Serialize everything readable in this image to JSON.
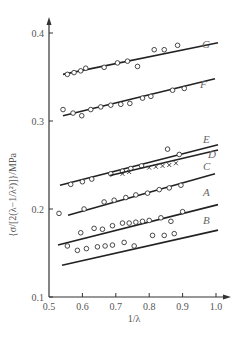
{
  "chart_data": {
    "type": "scatter",
    "title": "",
    "xlabel": "1/λ",
    "ylabel": "{σ/[2(λ−1/λ²)]}/MPa",
    "xlim": [
      0.5,
      1.0
    ],
    "ylim": [
      0.1,
      0.4
    ],
    "xticks": [
      "0.5",
      "0.6",
      "0.7",
      "0.8",
      "0.9",
      "1.0"
    ],
    "yticks": [
      "0.1",
      "0.2",
      "0.3",
      "0.4"
    ],
    "grid": false,
    "legend": "inline labels at right end of each line",
    "series": [
      {
        "name": "G",
        "marker": "o",
        "line": {
          "x": [
            0.542,
            1.006
          ],
          "y": [
            0.353,
            0.389
          ]
        },
        "points": {
          "x": [
            0.555,
            0.575,
            0.595,
            0.61,
            0.665,
            0.705,
            0.735,
            0.765,
            0.815,
            0.845,
            0.885
          ],
          "y": [
            0.353,
            0.355,
            0.357,
            0.36,
            0.361,
            0.366,
            0.368,
            0.362,
            0.381,
            0.381,
            0.386
          ]
        }
      },
      {
        "name": "F",
        "marker": "o",
        "line": {
          "x": [
            0.542,
            0.997
          ],
          "y": [
            0.306,
            0.348
          ]
        },
        "points": {
          "x": [
            0.542,
            0.572,
            0.598,
            0.625,
            0.655,
            0.685,
            0.715,
            0.742,
            0.78,
            0.805,
            0.87,
            0.905
          ],
          "y": [
            0.313,
            0.309,
            0.306,
            0.313,
            0.316,
            0.318,
            0.319,
            0.32,
            0.326,
            0.328,
            0.335,
            0.337
          ]
        }
      },
      {
        "name": "E",
        "marker": "o",
        "line": {
          "x": [
            0.533,
            1.006
          ],
          "y": [
            0.227,
            0.273
          ]
        },
        "points": {
          "x": [
            0.565,
            0.6,
            0.628,
            0.685,
            0.72,
            0.745,
            0.777,
            0.855,
            0.89
          ],
          "y": [
            0.228,
            0.231,
            0.234,
            0.24,
            0.243,
            0.246,
            0.249,
            0.268,
            0.262
          ]
        }
      },
      {
        "name": "D",
        "marker": "x",
        "line": {
          "x": [
            0.683,
            1.006
          ],
          "y": [
            0.238,
            0.267
          ]
        },
        "points": {
          "x": [
            0.72,
            0.74,
            0.8,
            0.82,
            0.84,
            0.86,
            0.88
          ],
          "y": [
            0.24,
            0.242,
            0.247,
            0.248,
            0.249,
            0.25,
            0.252
          ]
        }
      },
      {
        "name": "C",
        "marker": "o",
        "line": {
          "x": [
            0.557,
            0.997
          ],
          "y": [
            0.193,
            0.24
          ]
        },
        "points": {
          "x": [
            0.53,
            0.605,
            0.665,
            0.695,
            0.73,
            0.76,
            0.795,
            0.83,
            0.86,
            0.895
          ],
          "y": [
            0.195,
            0.2,
            0.208,
            0.21,
            0.213,
            0.216,
            0.218,
            0.222,
            0.224,
            0.227
          ]
        }
      },
      {
        "name": "A",
        "marker": "o",
        "line": {
          "x": [
            0.527,
            1.006
          ],
          "y": [
            0.159,
            0.205
          ]
        },
        "points": {
          "x": [
            0.595,
            0.635,
            0.66,
            0.69,
            0.72,
            0.74,
            0.76,
            0.78,
            0.8,
            0.835,
            0.865,
            0.9
          ],
          "y": [
            0.173,
            0.178,
            0.177,
            0.181,
            0.184,
            0.184,
            0.185,
            0.186,
            0.187,
            0.19,
            0.186,
            0.197
          ]
        }
      },
      {
        "name": "B",
        "marker": "o",
        "line": {
          "x": [
            0.539,
            1.006
          ],
          "y": [
            0.136,
            0.176
          ]
        },
        "points": {
          "x": [
            0.555,
            0.585,
            0.612,
            0.645,
            0.668,
            0.69,
            0.725,
            0.755,
            0.81,
            0.845,
            0.875
          ],
          "y": [
            0.158,
            0.153,
            0.155,
            0.157,
            0.158,
            0.159,
            0.162,
            0.158,
            0.17,
            0.17,
            0.172
          ]
        }
      }
    ]
  },
  "axes": {
    "x_title": "1/λ",
    "y_title": "{σ/[2(λ−1/λ²)]}/MPa",
    "x_ticks": [
      "0.5",
      "0.6",
      "0.7",
      "0.8",
      "0.9",
      "1.0"
    ],
    "y_ticks": [
      "0.1",
      "0.2",
      "0.3",
      "0.4"
    ]
  },
  "labels": {
    "G": "G",
    "F": "F",
    "E": "E",
    "D": "D",
    "C": "C",
    "A": "A",
    "B": "B"
  }
}
